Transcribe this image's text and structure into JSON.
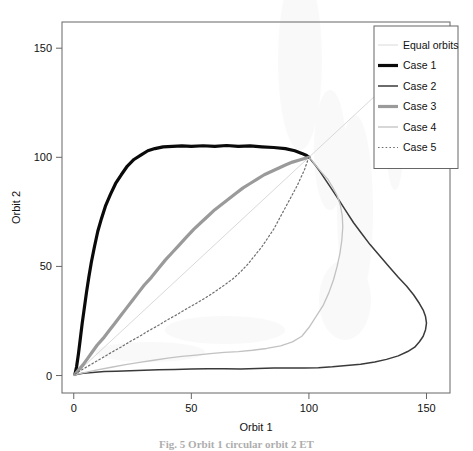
{
  "figure": {
    "caption": "Fig. 5 Orbit 1 circular orbit 2 ET"
  },
  "chart_data": {
    "type": "line",
    "title": "",
    "xlabel": "Orbit 1",
    "ylabel": "Orbit 2",
    "xlim": [
      -5,
      160
    ],
    "ylim": [
      -8,
      162
    ],
    "xticks": [
      0,
      50,
      100,
      150
    ],
    "yticks": [
      0,
      50,
      100,
      150
    ],
    "grid": false,
    "legend": {
      "position": "top-right",
      "entries": [
        {
          "name": "Equal orbits",
          "color": "#d9d9d9",
          "style": "solid",
          "width": 1
        },
        {
          "name": "Case 1",
          "color": "#0a0a0a",
          "style": "solid",
          "width": 3.2
        },
        {
          "name": "Case 2",
          "color": "#3a3a3a",
          "style": "solid",
          "width": 1.5
        },
        {
          "name": "Case 3",
          "color": "#9a9a9a",
          "style": "solid",
          "width": 3.2
        },
        {
          "name": "Case 4",
          "color": "#c2c2c2",
          "style": "solid",
          "width": 1.3
        },
        {
          "name": "Case 5",
          "color": "#6e6e6e",
          "style": "dotted",
          "width": 1.2
        }
      ]
    },
    "series": [
      {
        "name": "Equal orbits",
        "color": "#d9d9d9",
        "style": "solid",
        "width": 1,
        "points": [
          [
            0,
            0
          ],
          [
            150,
            150
          ]
        ]
      },
      {
        "name": "Case 1",
        "color": "#0a0a0a",
        "style": "solid",
        "width": 3.2,
        "points": [
          [
            0.5,
            0.5
          ],
          [
            1.2,
            4
          ],
          [
            2,
            10
          ],
          [
            2.8,
            17
          ],
          [
            3.6,
            24
          ],
          [
            4.5,
            31
          ],
          [
            5.4,
            38
          ],
          [
            6.4,
            45
          ],
          [
            7.5,
            52
          ],
          [
            8.8,
            59
          ],
          [
            10.2,
            66
          ],
          [
            11.8,
            72
          ],
          [
            13.6,
            78
          ],
          [
            15.6,
            83
          ],
          [
            17.8,
            88
          ],
          [
            20.2,
            92
          ],
          [
            22.8,
            96
          ],
          [
            25.6,
            99
          ],
          [
            28.5,
            101
          ],
          [
            31.5,
            103
          ],
          [
            34.5,
            104
          ],
          [
            38,
            104.8
          ],
          [
            42,
            105
          ],
          [
            46,
            105.2
          ],
          [
            50,
            105
          ],
          [
            55,
            105.3
          ],
          [
            60,
            105
          ],
          [
            65,
            105.4
          ],
          [
            70,
            105
          ],
          [
            75,
            105.2
          ],
          [
            80,
            104.8
          ],
          [
            85,
            104.5
          ],
          [
            90,
            104
          ],
          [
            94,
            103
          ],
          [
            97,
            101.8
          ],
          [
            99,
            100.8
          ],
          [
            100,
            100
          ]
        ]
      },
      {
        "name": "Case 2",
        "color": "#3a3a3a",
        "style": "solid",
        "width": 1.5,
        "points": [
          [
            0.5,
            0.4
          ],
          [
            4,
            1
          ],
          [
            8,
            1.4
          ],
          [
            13,
            1.8
          ],
          [
            18,
            2
          ],
          [
            24,
            2.2
          ],
          [
            30,
            2.4
          ],
          [
            36,
            2.6
          ],
          [
            43,
            2.8
          ],
          [
            50,
            3
          ],
          [
            57,
            3.1
          ],
          [
            64,
            3.1
          ],
          [
            71,
            3
          ],
          [
            78,
            3.2
          ],
          [
            85,
            3.4
          ],
          [
            92,
            3.4
          ],
          [
            98,
            3.5
          ],
          [
            104,
            3.6
          ],
          [
            110,
            4
          ],
          [
            116,
            4.6
          ],
          [
            122,
            5.2
          ],
          [
            128,
            6.2
          ],
          [
            133,
            7.4
          ],
          [
            138,
            9
          ],
          [
            142,
            11
          ],
          [
            145,
            13
          ],
          [
            147,
            15.5
          ],
          [
            148.6,
            18
          ],
          [
            149.6,
            21
          ],
          [
            150,
            24
          ],
          [
            149.6,
            27
          ],
          [
            148.6,
            30
          ],
          [
            147,
            33
          ],
          [
            144.5,
            37
          ],
          [
            141.5,
            41
          ],
          [
            138,
            45
          ],
          [
            134,
            50
          ],
          [
            130,
            55
          ],
          [
            126,
            60
          ],
          [
            122.5,
            65
          ],
          [
            119,
            70
          ],
          [
            116,
            75
          ],
          [
            113,
            80
          ],
          [
            110,
            85
          ],
          [
            107.5,
            89
          ],
          [
            105,
            93
          ],
          [
            103,
            96
          ],
          [
            101.5,
            98
          ],
          [
            100.5,
            99.3
          ],
          [
            100,
            100
          ]
        ]
      },
      {
        "name": "Case 3",
        "color": "#9a9a9a",
        "style": "solid",
        "width": 3.2,
        "points": [
          [
            0.5,
            0.5
          ],
          [
            2,
            2.5
          ],
          [
            4,
            5
          ],
          [
            6,
            8
          ],
          [
            8,
            11
          ],
          [
            10,
            14
          ],
          [
            12.5,
            17
          ],
          [
            15,
            20.5
          ],
          [
            17.5,
            24
          ],
          [
            20,
            27.5
          ],
          [
            22.5,
            31
          ],
          [
            25,
            34.5
          ],
          [
            27.5,
            38
          ],
          [
            30,
            41.5
          ],
          [
            33,
            45
          ],
          [
            36,
            49
          ],
          [
            39,
            53
          ],
          [
            42,
            56.5
          ],
          [
            45,
            60
          ],
          [
            48,
            63.5
          ],
          [
            51,
            67
          ],
          [
            54,
            70
          ],
          [
            57,
            73
          ],
          [
            60,
            76
          ],
          [
            63,
            78.5
          ],
          [
            66,
            81
          ],
          [
            69,
            83.5
          ],
          [
            72,
            86
          ],
          [
            75,
            88
          ],
          [
            78,
            90
          ],
          [
            81,
            92
          ],
          [
            84,
            93.5
          ],
          [
            87,
            95
          ],
          [
            90,
            96.5
          ],
          [
            93,
            97.8
          ],
          [
            96,
            98.8
          ],
          [
            98.5,
            99.6
          ],
          [
            100,
            100
          ]
        ]
      },
      {
        "name": "Case 4",
        "color": "#c2c2c2",
        "style": "solid",
        "width": 1.3,
        "points": [
          [
            0.5,
            0.4
          ],
          [
            5,
            1.5
          ],
          [
            10,
            2.6
          ],
          [
            16,
            3.8
          ],
          [
            22,
            5
          ],
          [
            28,
            6
          ],
          [
            34,
            7
          ],
          [
            40,
            8
          ],
          [
            46,
            8.8
          ],
          [
            52,
            9.4
          ],
          [
            58,
            10
          ],
          [
            64,
            10.6
          ],
          [
            70,
            11
          ],
          [
            76,
            11.6
          ],
          [
            82,
            12.4
          ],
          [
            88,
            13.6
          ],
          [
            93,
            15.4
          ],
          [
            97,
            18
          ],
          [
            100,
            22
          ],
          [
            103,
            27
          ],
          [
            106,
            32
          ],
          [
            108.5,
            38
          ],
          [
            110.5,
            44
          ],
          [
            112,
            50
          ],
          [
            113.2,
            56
          ],
          [
            114,
            62
          ],
          [
            114.4,
            68
          ],
          [
            114.2,
            73
          ],
          [
            113.4,
            78
          ],
          [
            112,
            82.5
          ],
          [
            110,
            86.5
          ],
          [
            108,
            90
          ],
          [
            105.5,
            93
          ],
          [
            103.5,
            95.5
          ],
          [
            102,
            97.5
          ],
          [
            101,
            99
          ],
          [
            100,
            100
          ]
        ]
      },
      {
        "name": "Case 5",
        "color": "#6e6e6e",
        "style": "dotted",
        "width": 1.2,
        "points": [
          [
            0.5,
            0.6
          ],
          [
            4,
            3
          ],
          [
            8,
            5.5
          ],
          [
            12,
            8
          ],
          [
            16,
            10.6
          ],
          [
            20,
            13
          ],
          [
            24,
            15.6
          ],
          [
            28,
            18
          ],
          [
            32,
            20.6
          ],
          [
            36,
            23
          ],
          [
            40,
            25.6
          ],
          [
            44,
            28
          ],
          [
            48,
            30.6
          ],
          [
            52,
            33
          ],
          [
            56,
            35.6
          ],
          [
            60,
            38.4
          ],
          [
            64,
            41.4
          ],
          [
            68,
            44.6
          ],
          [
            71,
            47.6
          ],
          [
            74,
            51
          ],
          [
            77,
            55
          ],
          [
            80,
            59
          ],
          [
            82.5,
            63
          ],
          [
            85,
            67
          ],
          [
            87,
            71
          ],
          [
            89,
            75
          ],
          [
            91,
            79
          ],
          [
            93,
            83
          ],
          [
            95,
            87
          ],
          [
            96.5,
            90.5
          ],
          [
            98,
            94
          ],
          [
            99,
            97
          ],
          [
            99.6,
            99
          ],
          [
            100,
            100
          ]
        ]
      }
    ]
  }
}
